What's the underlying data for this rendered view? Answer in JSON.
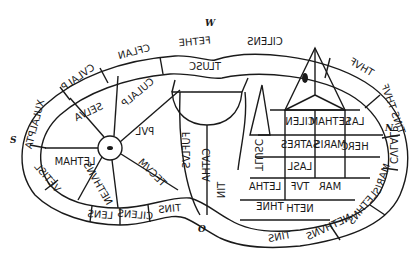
{
  "compass": {
    "west": "W",
    "south": "S",
    "north": "N",
    "origin": "O"
  },
  "outer_ring": [
    {
      "id": "r1",
      "text": "CILENS"
    },
    {
      "id": "r2",
      "text": "FETHE"
    },
    {
      "id": "r3",
      "text": "CFLAN"
    },
    {
      "id": "r4",
      "text": "CVLALP"
    },
    {
      "id": "r5",
      "text": "XULALPTA"
    },
    {
      "id": "r6",
      "text": "VETISL"
    },
    {
      "id": "r7",
      "text": "LENS"
    },
    {
      "id": "r8",
      "text": "CILENS"
    },
    {
      "id": "r9",
      "text": "TINS"
    },
    {
      "id": "r10",
      "text": "THVF"
    },
    {
      "id": "r11",
      "text": "TINS THVF"
    },
    {
      "id": "r12",
      "text": "CVLALP"
    },
    {
      "id": "r13",
      "text": "MARIS"
    },
    {
      "id": "r14",
      "text": "LETHNS"
    },
    {
      "id": "r15",
      "text": "NETHVNS"
    },
    {
      "id": "r16",
      "text": "TINS"
    }
  ],
  "inner": [
    {
      "id": "i1",
      "text": "TLUSC"
    },
    {
      "id": "i2",
      "text": "CULALP"
    },
    {
      "id": "i3",
      "text": "SELVA"
    },
    {
      "id": "i4",
      "text": "LETHAM"
    },
    {
      "id": "i5",
      "text": "NETHVNS"
    },
    {
      "id": "i6",
      "text": "PVL"
    },
    {
      "id": "i7",
      "text": "TECVM"
    },
    {
      "id": "i8",
      "text": "FUFLVS"
    },
    {
      "id": "i9",
      "text": "CATHA"
    },
    {
      "id": "i10",
      "text": "TLUSC"
    },
    {
      "id": "i11",
      "text": "CILEN"
    },
    {
      "id": "i12",
      "text": "LETHAM"
    },
    {
      "id": "i13",
      "text": "SATRES"
    },
    {
      "id": "i14",
      "text": "MARIS"
    },
    {
      "id": "i15",
      "text": "LASL"
    },
    {
      "id": "i16",
      "text": "HERC"
    },
    {
      "id": "i17",
      "text": "LETHA"
    },
    {
      "id": "i18",
      "text": "TVF"
    },
    {
      "id": "i19",
      "text": "MAR"
    },
    {
      "id": "i20",
      "text": "LAS"
    },
    {
      "id": "i21",
      "text": "THNE"
    },
    {
      "id": "i22",
      "text": "NETH"
    },
    {
      "id": "i23",
      "text": "TIN"
    }
  ],
  "numbers": [
    "1",
    "2",
    "3",
    "4",
    "5",
    "6",
    "7",
    "8",
    "9",
    "10",
    "11",
    "12",
    "13",
    "14",
    "15",
    "16"
  ]
}
